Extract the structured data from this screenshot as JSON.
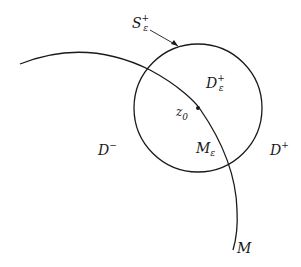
{
  "diagram": {
    "labels": {
      "s_eps_plus": {
        "base": "S",
        "sub": "ε",
        "sup": "+"
      },
      "d_eps_plus": {
        "base": "D",
        "sub": "ε",
        "sup": "+"
      },
      "z0": {
        "base": "z",
        "sub": "0"
      },
      "d_minus": {
        "base": "D",
        "sup": "−"
      },
      "m_eps": {
        "base": "M",
        "sub": "ε"
      },
      "d_plus": {
        "base": "D",
        "sup": "+"
      },
      "m": {
        "base": "M"
      }
    },
    "colors": {
      "stroke": "#1a1a1a",
      "background": "#ffffff"
    }
  }
}
